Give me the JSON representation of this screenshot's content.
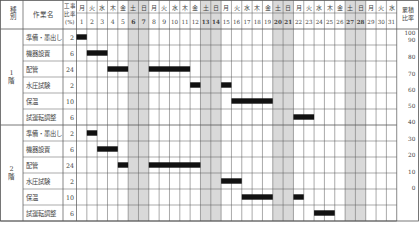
{
  "chart_data": {
    "type": "gantt",
    "title": "",
    "columns": {
      "category": "種別",
      "task": "作業名",
      "ratio": "工事比率(%)",
      "cumulative": "累積比率"
    },
    "days": [
      1,
      2,
      3,
      4,
      5,
      6,
      7,
      8,
      9,
      10,
      11,
      12,
      13,
      14,
      15,
      16,
      17,
      18,
      19,
      20,
      21,
      22,
      23,
      24,
      25,
      26,
      27,
      28,
      29,
      30,
      31
    ],
    "weekdays": [
      "月",
      "火",
      "水",
      "木",
      "金",
      "土",
      "日",
      "月",
      "火",
      "水",
      "木",
      "金",
      "土",
      "日",
      "月",
      "火",
      "水",
      "木",
      "金",
      "土",
      "日",
      "月",
      "火",
      "水",
      "木",
      "金",
      "土",
      "日",
      "月",
      "火",
      "水"
    ],
    "shaded_days": [
      6,
      7,
      13,
      14,
      20,
      21,
      27,
      28
    ],
    "groups": [
      {
        "label": "1階",
        "tasks": [
          {
            "name": "準備・墨出し",
            "ratio": "2",
            "segments": [
              [
                1,
                1
              ]
            ]
          },
          {
            "name": "機器設置",
            "ratio": "6",
            "segments": [
              [
                2,
                3
              ]
            ]
          },
          {
            "name": "配管",
            "ratio": "24",
            "segments": [
              [
                4,
                5
              ],
              [
                8,
                11
              ]
            ]
          },
          {
            "name": "水圧試験",
            "ratio": "2",
            "segments": [
              [
                12,
                12
              ],
              [
                15,
                15
              ]
            ]
          },
          {
            "name": "保温",
            "ratio": "10",
            "segments": [
              [
                16,
                19
              ]
            ]
          },
          {
            "name": "試運転調整",
            "ratio": "6",
            "segments": [
              [
                22,
                23
              ]
            ]
          }
        ]
      },
      {
        "label": "2階",
        "tasks": [
          {
            "name": "準備・墨出し",
            "ratio": "2",
            "segments": [
              [
                2,
                2
              ]
            ]
          },
          {
            "name": "機器設置",
            "ratio": "6",
            "segments": [
              [
                3,
                4
              ]
            ]
          },
          {
            "name": "配管",
            "ratio": "24",
            "segments": [
              [
                5,
                5
              ],
              [
                8,
                12
              ]
            ]
          },
          {
            "name": "水圧試験",
            "ratio": "2",
            "segments": [
              [
                15,
                16
              ]
            ]
          },
          {
            "name": "保温",
            "ratio": "10",
            "segments": [
              [
                17,
                19
              ],
              [
                22,
                22
              ]
            ]
          },
          {
            "name": "試運転調整",
            "ratio": "6",
            "segments": [
              [
                24,
                25
              ]
            ]
          }
        ]
      }
    ],
    "cumulative_scale": {
      "ticks": [
        "100",
        "90",
        "80",
        "70",
        "60",
        "50",
        "40",
        "30",
        "20",
        "10",
        "0"
      ],
      "range": [
        0,
        100
      ]
    },
    "colors": {
      "bar": "#111111",
      "shade": "#d9d9d9",
      "grid": "#555555"
    }
  }
}
